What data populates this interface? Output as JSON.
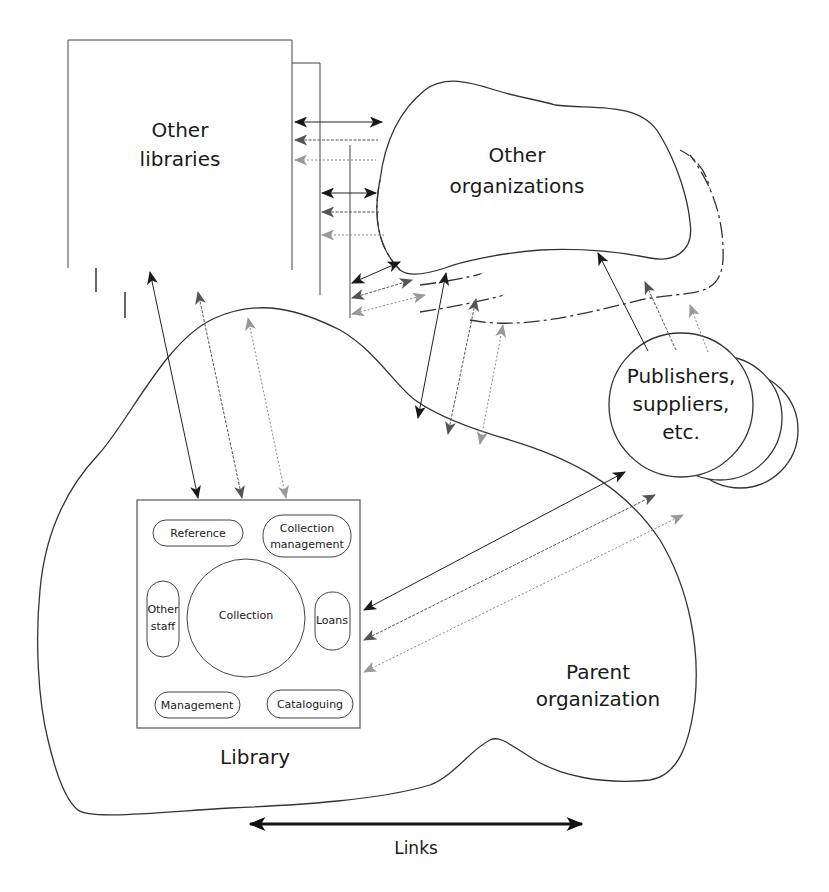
{
  "nodes": {
    "other_libraries": {
      "line1": "Other",
      "line2": "libraries"
    },
    "other_organizations": {
      "line1": "Other",
      "line2": "organizations"
    },
    "publishers": {
      "line1": "Publishers,",
      "line2": "suppliers,",
      "line3": "etc."
    },
    "parent_organization": {
      "line1": "Parent",
      "line2": "organization"
    },
    "library": {
      "label": "Library",
      "units": {
        "reference": "Reference",
        "collection_management_1": "Collection",
        "collection_management_2": "management",
        "other_staff_1": "Other",
        "other_staff_2": "staff",
        "collection": "Collection",
        "loans": "Loans",
        "management": "Management",
        "cataloguing": "Cataloguing"
      }
    }
  },
  "legend": {
    "label": "Links"
  },
  "colors": {
    "link_black": "#222222",
    "link_dark": "#555555",
    "link_light": "#999999",
    "outline": "#333333"
  }
}
